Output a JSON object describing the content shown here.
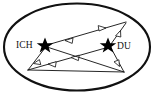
{
  "figure": {
    "type": "relationship-diagram",
    "shape": "ellipse",
    "background_color": "#ffffff",
    "line_color": "#1a1a1a",
    "border_color": "#111111",
    "arrow_fill": "#ffffff",
    "star_color": "#000000"
  },
  "nodes": [
    {
      "id": "ich",
      "label": "ICH",
      "marker": "star",
      "label_position": "left",
      "x": 45,
      "y": 45
    },
    {
      "id": "du",
      "label": "DU",
      "marker": "star",
      "label_position": "right",
      "x": 110,
      "y": 45
    },
    {
      "id": "top_right",
      "label": "",
      "marker": "none",
      "x": 126,
      "y": 22
    },
    {
      "id": "bottom_left",
      "label": "",
      "marker": "none",
      "x": 28,
      "y": 70
    },
    {
      "id": "bottom_right",
      "label": "",
      "marker": "none",
      "x": 124,
      "y": 72
    }
  ],
  "edges": [
    {
      "id": "e1",
      "from": "ich",
      "to": "top_right",
      "arrows": [
        "backward",
        "forward"
      ]
    },
    {
      "id": "e2",
      "from": "top_right",
      "to": "du",
      "arrows": [
        "backward"
      ]
    },
    {
      "id": "e3",
      "from": "du",
      "to": "bottom_left",
      "arrows": [
        "forward",
        "forward"
      ]
    },
    {
      "id": "e4",
      "from": "ich",
      "to": "bottom_left",
      "arrows": [
        "forward"
      ]
    },
    {
      "id": "e5",
      "from": "ich",
      "to": "bottom_right",
      "arrows": []
    },
    {
      "id": "e6",
      "from": "du",
      "to": "bottom_right",
      "arrows": [
        "forward"
      ]
    },
    {
      "id": "e7",
      "from": "bottom_left",
      "to": "bottom_right",
      "arrows": []
    }
  ],
  "ellipse": {
    "cx": 77,
    "cy": 47,
    "rx": 74,
    "ry": 44
  }
}
